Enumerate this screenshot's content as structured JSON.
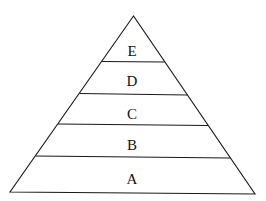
{
  "diagram": {
    "type": "pyramid",
    "levels_top_to_bottom": [
      {
        "label": "E"
      },
      {
        "label": "D"
      },
      {
        "label": "C"
      },
      {
        "label": "B"
      },
      {
        "label": "A"
      }
    ],
    "stroke_color": "#1a1a1a",
    "fill_color": "#ffffff"
  }
}
